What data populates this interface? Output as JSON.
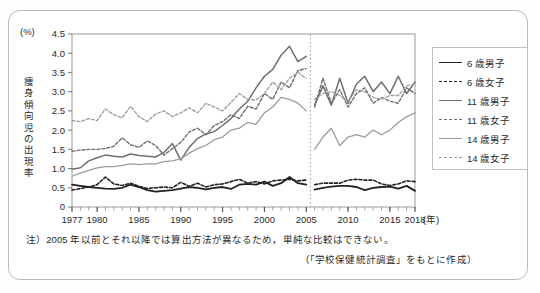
{
  "figure": {
    "unit_label": "(%)",
    "y_axis_title": "痩身傾向児の出現率",
    "x_axis_unit": "(年)",
    "note": "注）2005 年以前とそれ以降では算出方法が異なるため，単純な比較はできない。",
    "source": "（「学校保健統計調査」をもとに作成）"
  },
  "legend": {
    "items": [
      {
        "label": "6 歳男子",
        "color": "#222222",
        "dash": "none",
        "width": 1.8
      },
      {
        "label": "6 歳女子",
        "color": "#222222",
        "dash": "3,2",
        "width": 1.6
      },
      {
        "label": "11 歳男子",
        "color": "#6e6e6e",
        "dash": "none",
        "width": 1.5
      },
      {
        "label": "11 歳女子",
        "color": "#6e6e6e",
        "dash": "3,2",
        "width": 1.4
      },
      {
        "label": "14 歳男子",
        "color": "#9c9c9c",
        "dash": "none",
        "width": 1.3
      },
      {
        "label": "14 歳女子",
        "color": "#9c9c9c",
        "dash": "3,2",
        "width": 1.3
      }
    ]
  },
  "chart_data": {
    "type": "line",
    "title": "",
    "xlabel": "(年)",
    "ylabel": "痩身傾向児の出現率 (%)",
    "xlim": [
      1977,
      2018
    ],
    "ylim": [
      0,
      4.5
    ],
    "ytick_values": [
      0,
      0.5,
      1.0,
      1.5,
      2.0,
      2.5,
      3.0,
      3.5,
      4.0,
      4.5
    ],
    "ytick_labels": [
      "0",
      "0.5",
      "1.0",
      "1.5",
      "2.0",
      "2.5",
      "3.0",
      "3.5",
      "4.0",
      "4.5"
    ],
    "xtick_values": [
      1977,
      1980,
      1985,
      1990,
      1995,
      2000,
      2005,
      2010,
      2015,
      2018
    ],
    "xtick_labels": [
      "1977",
      "1980",
      "1985",
      "1990",
      "1995",
      "2000",
      "2005",
      "2010",
      "2015",
      "2018"
    ],
    "minor_xticks_every": 1,
    "grid": false,
    "legend_position": "right-outside",
    "break_line": {
      "at_x": 2005.5,
      "style": "dotted",
      "color": "#9a9a9a",
      "reason": "算出方法の変更"
    },
    "x": [
      1977,
      1978,
      1979,
      1980,
      1981,
      1982,
      1983,
      1984,
      1985,
      1986,
      1987,
      1988,
      1989,
      1990,
      1991,
      1992,
      1993,
      1994,
      1995,
      1996,
      1997,
      1998,
      1999,
      2000,
      2001,
      2002,
      2003,
      2004,
      2005
    ],
    "x2": [
      2006,
      2007,
      2008,
      2009,
      2010,
      2011,
      2012,
      2013,
      2014,
      2015,
      2016,
      2017,
      2018
    ],
    "series": [
      {
        "name": "6 歳男子",
        "color": "#222222",
        "dash": "none",
        "width": 1.8,
        "values": [
          0.58,
          0.55,
          0.52,
          0.5,
          0.48,
          0.47,
          0.5,
          0.58,
          0.52,
          0.44,
          0.4,
          0.42,
          0.44,
          0.48,
          0.52,
          0.5,
          0.46,
          0.5,
          0.52,
          0.47,
          0.58,
          0.6,
          0.58,
          0.66,
          0.55,
          0.62,
          0.78,
          0.62,
          0.58
        ],
        "values2": [
          0.45,
          0.5,
          0.53,
          0.55,
          0.55,
          0.52,
          0.44,
          0.5,
          0.52,
          0.53,
          0.48,
          0.55,
          0.42
        ]
      },
      {
        "name": "6 歳女子",
        "color": "#222222",
        "dash": "3,2",
        "width": 1.6,
        "values": [
          0.44,
          0.48,
          0.52,
          0.58,
          0.78,
          0.6,
          0.56,
          0.62,
          0.54,
          0.48,
          0.5,
          0.52,
          0.5,
          0.64,
          0.54,
          0.62,
          0.52,
          0.58,
          0.6,
          0.66,
          0.72,
          0.62,
          0.66,
          0.6,
          0.68,
          0.7,
          0.72,
          0.68,
          0.7
        ],
        "values2": [
          0.58,
          0.62,
          0.62,
          0.62,
          0.7,
          0.72,
          0.7,
          0.7,
          0.6,
          0.56,
          0.6,
          0.68,
          0.66
        ]
      },
      {
        "name": "11 歳男子",
        "color": "#6e6e6e",
        "dash": "none",
        "width": 1.5,
        "values": [
          0.98,
          1.02,
          1.2,
          1.28,
          1.35,
          1.32,
          1.3,
          1.38,
          1.34,
          1.32,
          1.3,
          1.42,
          1.65,
          1.22,
          1.55,
          1.78,
          1.9,
          1.96,
          2.12,
          2.3,
          2.55,
          2.75,
          3.1,
          3.4,
          3.58,
          3.95,
          4.18,
          3.78,
          3.92
        ],
        "values2": [
          2.65,
          3.15,
          2.65,
          3.35,
          2.7,
          3.2,
          3.4,
          3.0,
          3.25,
          2.95,
          3.4,
          2.95,
          3.25
        ]
      },
      {
        "name": "11 歳女子",
        "color": "#6e6e6e",
        "dash": "3,2",
        "width": 1.4,
        "values": [
          1.45,
          1.48,
          1.5,
          1.5,
          1.52,
          1.58,
          1.8,
          1.62,
          1.55,
          1.72,
          1.6,
          1.35,
          1.52,
          1.68,
          1.95,
          2.05,
          1.88,
          2.12,
          2.22,
          2.4,
          2.3,
          2.62,
          2.55,
          2.95,
          2.8,
          3.25,
          3.1,
          3.55,
          3.6
        ],
        "values2": [
          2.6,
          3.35,
          2.7,
          3.05,
          2.6,
          2.95,
          3.1,
          2.7,
          2.85,
          2.75,
          2.7,
          3.1,
          2.95
        ]
      },
      {
        "name": "14 歳男子",
        "color": "#9c9c9c",
        "dash": "none",
        "width": 1.3,
        "values": [
          0.8,
          0.88,
          0.95,
          1.02,
          1.05,
          1.05,
          1.08,
          1.12,
          1.1,
          1.12,
          1.12,
          1.18,
          1.2,
          1.25,
          1.4,
          1.52,
          1.6,
          1.75,
          1.82,
          2.0,
          2.05,
          2.2,
          2.15,
          2.45,
          2.6,
          2.85,
          2.8,
          2.7,
          2.5
        ],
        "values2": [
          1.5,
          1.82,
          2.05,
          1.6,
          1.82,
          1.88,
          1.82,
          2.0,
          1.88,
          2.0,
          2.2,
          2.35,
          2.45
        ]
      },
      {
        "name": "14 歳女子",
        "color": "#9c9c9c",
        "dash": "3,2",
        "width": 1.3,
        "values": [
          2.25,
          2.22,
          2.3,
          2.25,
          2.55,
          2.4,
          2.32,
          2.62,
          2.35,
          2.22,
          2.42,
          2.5,
          2.35,
          2.45,
          2.58,
          2.45,
          2.7,
          2.6,
          2.5,
          2.72,
          2.95,
          2.8,
          2.78,
          2.95,
          3.25,
          3.05,
          3.35,
          3.5,
          3.35
        ],
        "values2": [
          2.8,
          2.95,
          3.0,
          2.9,
          2.75,
          3.05,
          3.0,
          2.85,
          2.8,
          2.9,
          2.9,
          3.15,
          3.2
        ]
      }
    ]
  }
}
